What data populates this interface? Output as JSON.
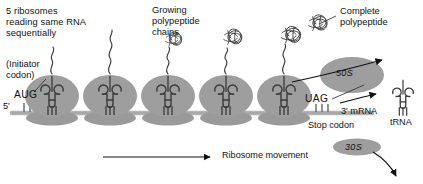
{
  "diagram": {
    "background_color": "#ffffff",
    "ink_color": "#111111",
    "ribosome_fill": "#9a9a9a",
    "subunit_fill": "#8f8f8f",
    "mrna_color": "#b3b3b3"
  },
  "labels": {
    "polysome_note": "5 ribosomes\nreading same RNA\nsequentially",
    "initiator_codon": "(Initiator\ncodon)",
    "start_codon": "AUG",
    "five_prime": "5'",
    "growing_chains": "Growing\npolypeptide\nchains",
    "complete_polypeptide": "Complete\npolypeptide",
    "stop_codon_seq": "UAG",
    "three_prime_mrna": "3' mRNA",
    "stop_codon": "Stop codon",
    "trna": "tRNA",
    "ribosome_movement": "Ribosome movement",
    "large_subunit": "50S",
    "small_subunit": "30S"
  },
  "ribosomes": {
    "count": 5,
    "centers_x": [
      52,
      108,
      164,
      220,
      276
    ],
    "baseline_y": 113
  },
  "mrna": {
    "start_x": 12,
    "end_x": 372,
    "y": 113,
    "codon_ticks": {
      "start": 3,
      "stop": 3
    }
  },
  "free_particles": [
    {
      "name": "50S",
      "shape": "ellipse",
      "cx": 352,
      "cy": 75,
      "rx": 32,
      "ry": 18
    },
    {
      "name": "30S",
      "shape": "ellipse",
      "cx": 357,
      "cy": 147,
      "rx": 24,
      "ry": 9
    }
  ],
  "arrows": [
    {
      "name": "ribosome-movement-arrow",
      "from_x": 103,
      "from_y": 157,
      "to_x": 213,
      "to_y": 157
    },
    {
      "name": "polypeptide-release-arrow",
      "from_x": 291,
      "from_y": 82,
      "to_x": 385,
      "to_y": 61
    },
    {
      "name": "subunit-release-arrow",
      "from_x": 370,
      "from_y": 151,
      "to_x": 397,
      "to_y": 179
    },
    {
      "name": "trna-release-arrow",
      "from_x": 345,
      "from_y": 102,
      "to_x": 378,
      "to_y": 94
    }
  ],
  "leader_lines": [
    {
      "name": "initiator-codon-leader",
      "x1": 46,
      "y1": 79,
      "x2": 33,
      "y2": 92
    },
    {
      "name": "complete-polypeptide-leader",
      "x1": 336,
      "y1": 16,
      "x2": 317,
      "y2": 25
    },
    {
      "name": "stop-codon-leader",
      "x1": 339,
      "y1": 93,
      "x2": 362,
      "y2": 85
    }
  ]
}
